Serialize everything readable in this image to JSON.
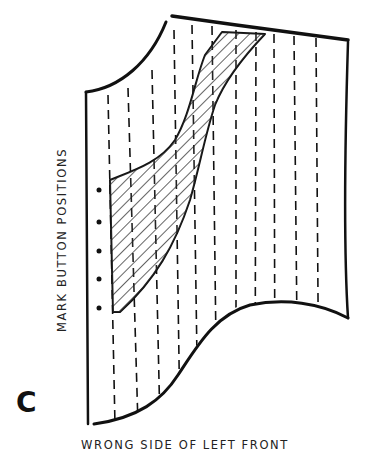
{
  "figure": {
    "letter": "C",
    "side_label": "MARK BUTTON POSITIONS",
    "caption": "WRONG SIDE OF LEFT FRONT",
    "button_marks": 5,
    "colors": {
      "ink": "#111111",
      "background": "#ffffff"
    }
  }
}
